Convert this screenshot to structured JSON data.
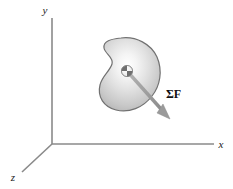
{
  "figure": {
    "background_color": "#ffffff"
  },
  "axes": {
    "origin": {
      "x": 52,
      "y": 144
    },
    "color": "#808080",
    "items": [
      {
        "name": "y-axis",
        "label": "y",
        "label_x": 45,
        "label_y": 14,
        "x1": 52,
        "y1": 18,
        "x2": 52,
        "y2": 144
      },
      {
        "name": "x-axis",
        "label": "x",
        "label_x": 220,
        "label_y": 147,
        "x1": 52,
        "y1": 144,
        "x2": 214,
        "y2": 144
      },
      {
        "name": "z-axis",
        "label": "z",
        "label_x": 11,
        "label_y": 180,
        "x1": 52,
        "y1": 144,
        "x2": 22,
        "y2": 172
      }
    ]
  },
  "body": {
    "name": "rigid-body-blob",
    "outline_color": "#6b6b6b",
    "fill_light": "#fdfdfd",
    "fill_mid": "#d8d8d8",
    "fill_dark": "#a8a8a8",
    "path": "M 121 38 C 136 36 150 43 156 56 C 162 69 160 83 153 94 C 145 106 132 112 119 110 C 106 108 98 99 100 86 C 102 75 111 70 112 63 C 113 56 105 53 104 47 C 103 41 111 39 121 38 Z"
  },
  "center_of_mass": {
    "name": "center-of-mass-marker",
    "cx": 127,
    "cy": 71,
    "r": 5.5,
    "light_color": "#f2f2f2",
    "dark_color": "#6e6e6e"
  },
  "force_arrow": {
    "name": "resultant-force-arrow",
    "label": "ΣF",
    "sigma": "Σ",
    "bold_symbol": "F",
    "color": "#9a9a9a",
    "stroke_width": 3.2,
    "tail_x": 127,
    "tail_y": 71,
    "tip_x": 168,
    "tip_y": 117,
    "label_x": 166,
    "label_y": 98
  }
}
